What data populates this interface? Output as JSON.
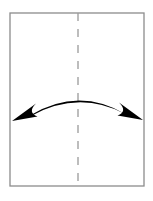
{
  "figure": {
    "title": "Curved double-headed arrow spanning a bordered rectangle bisected by a dashed center line",
    "caption": "",
    "background_color": "#ffffff"
  },
  "frame": {
    "name": "page-border-rectangle",
    "x": 10,
    "y": 13,
    "width": 134,
    "height": 173,
    "stroke_color": "#8c8c8c",
    "stroke_width": 1.3,
    "fill_color": "#ffffff"
  },
  "center_line": {
    "name": "vertical-dashed-fold-line",
    "x": 78,
    "y_start": 13,
    "y_end": 186,
    "stroke_color": "#9a9a9a",
    "stroke_width": 1.3,
    "dash_length": 8,
    "gap_length": 8,
    "orientation": "vertical"
  },
  "arrow": {
    "name": "curved-double-headed-arrow",
    "stroke_color": "#000000",
    "fill_color": "#000000",
    "left_tip": {
      "x": 12,
      "y": 121
    },
    "right_tip": {
      "x": 143,
      "y": 120
    },
    "apex": {
      "x": 78,
      "y": 101
    },
    "bow_direction": "upward",
    "head_style": "barbed-solid-triangle",
    "head_count": 2,
    "left_head_direction": "down-left",
    "right_head_direction": "down-right",
    "shaft_taper": "thin-at-apex-thick-at-ends"
  },
  "colors": {
    "ink": "#000000",
    "border_gray": "#8c8c8c",
    "dash_gray": "#9a9a9a",
    "paper": "#ffffff"
  }
}
